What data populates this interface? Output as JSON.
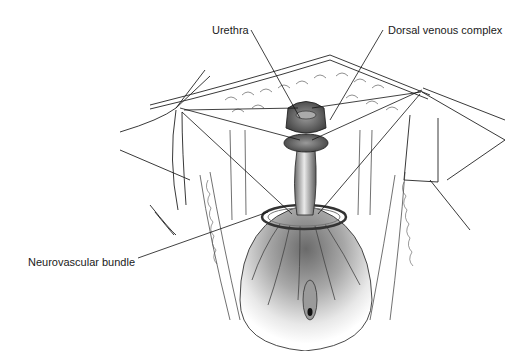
{
  "figure": {
    "type": "anatomical-illustration",
    "style": "grayscale line drawing",
    "labels": [
      {
        "id": "urethra",
        "text": "Urethra"
      },
      {
        "id": "dorsal-venous-complex",
        "text": "Dorsal venous complex"
      },
      {
        "id": "neurovascular-bundle",
        "text": "Neurovascular bundle"
      }
    ]
  },
  "colors": {
    "background": "#ffffff",
    "ink": "#1a1a1a",
    "shade_dark": "#4a4a4a",
    "shade_mid": "#8a8a8a",
    "shade_light": "#d0d0d0"
  }
}
